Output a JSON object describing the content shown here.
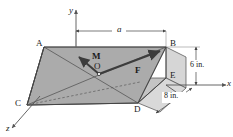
{
  "figure": {
    "background_color": "#ffffff",
    "body_fill_top": "#a8a8a8",
    "body_fill_front": "#bdbdbd",
    "body_fill_left": "#b4b4b4",
    "body_fill_right": "#d2d2d2",
    "line_color": "#333333",
    "vector_color": "#3c3c3c",
    "axis_color": "#555555"
  },
  "axes": [
    {
      "id": "y-axis",
      "label": "y",
      "direction": "up"
    },
    {
      "id": "x-axis",
      "label": "x",
      "direction": "right"
    },
    {
      "id": "z-axis",
      "label": "z",
      "direction": "lower-left"
    }
  ],
  "vertices": [
    {
      "id": "A",
      "label": "A"
    },
    {
      "id": "B",
      "label": "B"
    },
    {
      "id": "C",
      "label": "C"
    },
    {
      "id": "D",
      "label": "D"
    },
    {
      "id": "E",
      "label": "E"
    },
    {
      "id": "O",
      "label": "O"
    }
  ],
  "vectors": [
    {
      "id": "M",
      "label": "M",
      "kind": "moment",
      "direction": "upper-left"
    },
    {
      "id": "F",
      "label": "F",
      "kind": "force",
      "direction": "upper-right"
    }
  ],
  "dimensions": [
    {
      "id": "a",
      "label": "a",
      "orientation": "horizontal",
      "span": "A to B"
    },
    {
      "id": "height",
      "label": "6 in.",
      "orientation": "vertical",
      "span": "B to E"
    },
    {
      "id": "depth",
      "label": "8 in.",
      "orientation": "oblique",
      "span": "D to E"
    }
  ]
}
